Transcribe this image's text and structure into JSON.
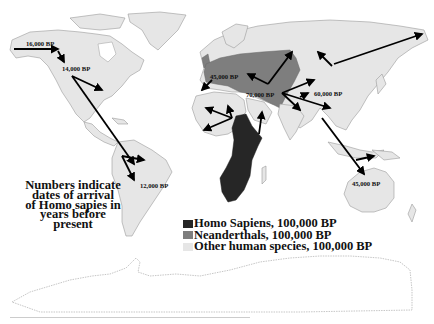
{
  "note": {
    "lines": [
      "Numbers indicate",
      "dates of arrival",
      "of Homo sapies in",
      "years before",
      "present"
    ]
  },
  "legend": [
    {
      "label": "Homo Sapiens, 100,000 BP",
      "color": "#262626"
    },
    {
      "label": "Neanderthals, 100,000 BP",
      "color": "#7e7e7e"
    },
    {
      "label": "Other human species, 100,000 BP",
      "color": "#e6e6e6"
    }
  ],
  "labels": {
    "alaska": "16,000 BP",
    "north_america": "14,000 BP",
    "south_america": "12,000 BP",
    "europe": "45,000 BP",
    "middle_east": "70,000 BP",
    "east_asia": "60,000 BP",
    "australia": "45,000 BP"
  },
  "colors": {
    "homo_sapiens": "#262626",
    "neanderthals": "#7e7e7e",
    "other": "#e6e6e6",
    "arrow": "#000000"
  }
}
